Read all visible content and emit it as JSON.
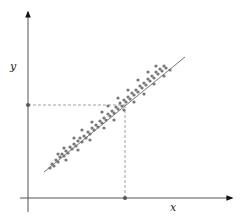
{
  "figure": {
    "axes": {
      "x_label": "x",
      "y_label": "y",
      "color": "#555555"
    },
    "colors": {
      "axis": "#555555",
      "points": "#777777",
      "line": "#777777",
      "dashed": "#888888",
      "marker": "#555555"
    }
  },
  "chart_data": {
    "type": "scatter",
    "title": "",
    "xlabel": "x",
    "ylabel": "y",
    "grid": false,
    "legend": null,
    "origin_px": [
      28,
      198
    ],
    "xlim": [
      0,
      215
    ],
    "ylim": [
      0,
      190
    ],
    "regression_line": {
      "x0": 16,
      "y0": 26,
      "x1": 157,
      "y1": 141
    },
    "projection_point": {
      "x": 97,
      "y": 93
    },
    "points": [
      [
        22,
        30
      ],
      [
        24,
        34
      ],
      [
        26,
        32
      ],
      [
        28,
        38
      ],
      [
        30,
        36
      ],
      [
        32,
        41
      ],
      [
        34,
        44
      ],
      [
        36,
        42
      ],
      [
        38,
        47
      ],
      [
        40,
        45
      ],
      [
        42,
        51
      ],
      [
        44,
        49
      ],
      [
        46,
        54
      ],
      [
        48,
        52
      ],
      [
        50,
        57
      ],
      [
        52,
        60
      ],
      [
        54,
        56
      ],
      [
        56,
        62
      ],
      [
        58,
        60
      ],
      [
        60,
        66
      ],
      [
        62,
        64
      ],
      [
        64,
        70
      ],
      [
        66,
        68
      ],
      [
        68,
        73
      ],
      [
        70,
        71
      ],
      [
        72,
        77
      ],
      [
        74,
        75
      ],
      [
        76,
        80
      ],
      [
        78,
        78
      ],
      [
        80,
        84
      ],
      [
        82,
        82
      ],
      [
        84,
        87
      ],
      [
        86,
        85
      ],
      [
        88,
        91
      ],
      [
        90,
        89
      ],
      [
        92,
        95
      ],
      [
        94,
        92
      ],
      [
        96,
        98
      ],
      [
        98,
        96
      ],
      [
        100,
        101
      ],
      [
        102,
        99
      ],
      [
        104,
        105
      ],
      [
        106,
        103
      ],
      [
        108,
        108
      ],
      [
        110,
        106
      ],
      [
        112,
        112
      ],
      [
        114,
        110
      ],
      [
        116,
        115
      ],
      [
        118,
        113
      ],
      [
        120,
        119
      ],
      [
        122,
        117
      ],
      [
        124,
        122
      ],
      [
        126,
        120
      ],
      [
        128,
        126
      ],
      [
        130,
        124
      ],
      [
        132,
        129
      ],
      [
        134,
        127
      ],
      [
        136,
        132
      ],
      [
        138,
        130
      ],
      [
        142,
        128
      ],
      [
        30,
        44
      ],
      [
        36,
        50
      ],
      [
        46,
        60
      ],
      [
        54,
        68
      ],
      [
        64,
        76
      ],
      [
        74,
        86
      ],
      [
        80,
        92
      ],
      [
        90,
        100
      ],
      [
        100,
        108
      ],
      [
        110,
        118
      ],
      [
        120,
        126
      ],
      [
        128,
        132
      ],
      [
        38,
        38
      ],
      [
        50,
        48
      ],
      [
        62,
        58
      ],
      [
        76,
        70
      ],
      [
        86,
        78
      ],
      [
        96,
        88
      ],
      [
        106,
        96
      ],
      [
        116,
        104
      ],
      [
        126,
        114
      ],
      [
        136,
        122
      ]
    ]
  }
}
